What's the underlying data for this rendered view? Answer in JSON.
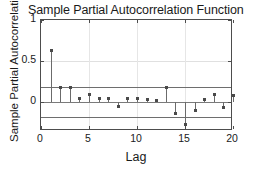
{
  "chart_data": {
    "type": "bar",
    "title": "Sample Partial Autocorrelation Function",
    "xlabel": "Lag",
    "ylabel": "Sample Partial Autocorrelation",
    "x": [
      1,
      2,
      3,
      4,
      5,
      6,
      7,
      8,
      9,
      10,
      11,
      12,
      13,
      14,
      15,
      16,
      17,
      18,
      19,
      20
    ],
    "values": [
      0.63,
      0.18,
      0.18,
      0.04,
      0.09,
      0.05,
      0.04,
      -0.05,
      0.04,
      0.04,
      0.03,
      0.02,
      0.18,
      -0.14,
      -0.27,
      -0.1,
      0.03,
      0.1,
      -0.06,
      0.08
    ],
    "xlim": [
      0,
      20
    ],
    "ylim": [
      -0.35,
      1.0
    ],
    "xticks": [
      "0",
      "5",
      "10",
      "15",
      "20"
    ],
    "xtick_values": [
      0,
      5,
      10,
      15,
      20
    ],
    "yticks": [
      "1",
      "0.5",
      "0"
    ],
    "ytick_values": [
      1,
      0.5,
      0
    ],
    "grid": true,
    "legend": "none",
    "confidence_bounds": [
      0.18,
      -0.18
    ],
    "series_name": "Sample Partial Autocorrelation",
    "marker_color": "#4a4a4a",
    "stem_color": "#6b6b6b",
    "bound_color": "#6e6e6e",
    "axis_color": "#4d4d4d"
  }
}
